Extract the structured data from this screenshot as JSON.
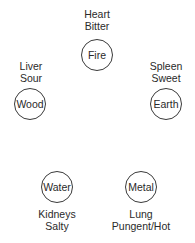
{
  "diagram": {
    "title": "",
    "elements": [
      {
        "name": "Fire",
        "organ": "Heart",
        "taste": "Bitter"
      },
      {
        "name": "Earth",
        "organ": "Spleen",
        "taste": "Sweet"
      },
      {
        "name": "Metal",
        "organ": "Lung",
        "taste": "Pungent/Hot"
      },
      {
        "name": "Water",
        "organ": "Kidneys",
        "taste": "Salty"
      },
      {
        "name": "Wood",
        "organ": "Liver",
        "taste": "Sour"
      }
    ]
  }
}
